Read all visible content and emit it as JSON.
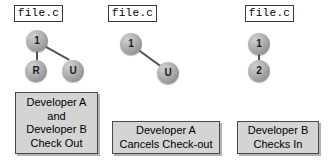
{
  "diagram": {
    "background_color": "#ffffff",
    "node_color": "#b4b4b4",
    "caption_box_color": "#d4d4d4",
    "border_color": "#3a3a3a",
    "groups": [
      {
        "id": "group-check-out",
        "file_label": "file.c",
        "nodes": [
          {
            "id": "g1-n1",
            "label": "1"
          },
          {
            "id": "g1-r",
            "label": "R"
          },
          {
            "id": "g1-u",
            "label": "U"
          }
        ],
        "caption_lines": [
          "Developer A",
          "and",
          "Developer B",
          "Check Out"
        ]
      },
      {
        "id": "group-cancel-check-out",
        "file_label": "file.c",
        "nodes": [
          {
            "id": "g2-n1",
            "label": "1"
          },
          {
            "id": "g2-u",
            "label": "U"
          }
        ],
        "caption_lines": [
          "Developer A",
          "Cancels Check-out"
        ]
      },
      {
        "id": "group-check-in",
        "file_label": "file.c",
        "nodes": [
          {
            "id": "g3-n1",
            "label": "1"
          },
          {
            "id": "g3-n2",
            "label": "2"
          }
        ],
        "caption_lines": [
          "Developer B",
          "Checks In"
        ]
      }
    ]
  }
}
